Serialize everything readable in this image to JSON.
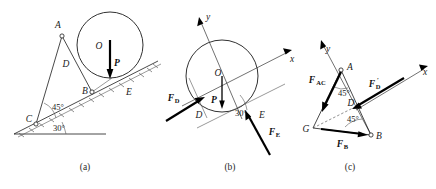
{
  "figure": {
    "captions": [
      {
        "key": "a",
        "text": "(a)"
      },
      {
        "key": "b",
        "text": "(b)"
      },
      {
        "key": "c",
        "text": "(c)"
      }
    ]
  },
  "panel_a": {
    "caption": "(a)",
    "points": [
      {
        "name": "A",
        "label": "A"
      },
      {
        "name": "B",
        "label": "B"
      },
      {
        "name": "C",
        "label": "C"
      },
      {
        "name": "D",
        "label": "D"
      },
      {
        "name": "E",
        "label": "E"
      },
      {
        "name": "O",
        "label": "O"
      }
    ],
    "vectors": [
      {
        "name": "weight",
        "label": "P"
      }
    ],
    "angles": [
      {
        "name": "bar-angle",
        "label": "45°"
      },
      {
        "name": "incline-angle",
        "label": "30°"
      }
    ]
  },
  "panel_b": {
    "caption": "(b)",
    "points": [
      {
        "name": "O",
        "label": "O"
      },
      {
        "name": "D",
        "label": "D"
      },
      {
        "name": "E",
        "label": "E"
      }
    ],
    "axes": [
      {
        "name": "x",
        "label": "x"
      },
      {
        "name": "y",
        "label": "y"
      }
    ],
    "vectors": [
      {
        "name": "weight",
        "label": "P",
        "sub": ""
      },
      {
        "name": "force-D",
        "label": "F",
        "sub": "D"
      },
      {
        "name": "force-E",
        "label": "F",
        "sub": "E"
      }
    ],
    "angles": [
      {
        "name": "incline-angle",
        "label": "30°"
      }
    ]
  },
  "panel_c": {
    "caption": "(c)",
    "points": [
      {
        "name": "A",
        "label": "A"
      },
      {
        "name": "B",
        "label": "B"
      },
      {
        "name": "D",
        "label": "D"
      },
      {
        "name": "G",
        "label": "G"
      }
    ],
    "axes": [
      {
        "name": "x",
        "label": "x"
      },
      {
        "name": "y",
        "label": "y"
      }
    ],
    "vectors": [
      {
        "name": "force-AC",
        "label": "F",
        "sub": "AC"
      },
      {
        "name": "force-D-prime",
        "label": "F",
        "sub": "D",
        "prime": "′"
      },
      {
        "name": "force-B",
        "label": "F",
        "sub": "B"
      }
    ],
    "angles": [
      {
        "name": "angle-at-A",
        "label": "45°"
      },
      {
        "name": "angle-at-B",
        "label": "45°"
      }
    ]
  },
  "colors": {
    "ink": "#1a1a1a",
    "vector": "#000000",
    "thin": "#555555",
    "background": "#ffffff"
  }
}
